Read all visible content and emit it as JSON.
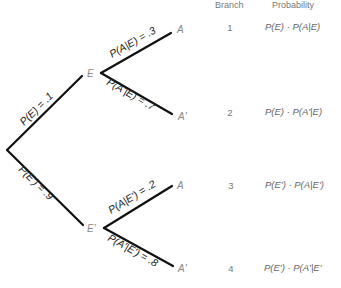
{
  "header": {
    "branch": "Branch",
    "probability": "Probability"
  },
  "nodes": {
    "E": "E",
    "E_prime": "E'",
    "A1": "A",
    "A1_prime": "A'",
    "A2": "A",
    "A2_prime": "A'"
  },
  "edge_labels": {
    "root_E": "P(E) = .1",
    "root_E_prime": "P(E') = .9",
    "E_A": "P(A|E) = .3",
    "E_A_prime": "P(A'|E) = .7",
    "Ep_A": "P(A|E') = .2",
    "Ep_A_prime": "P(A'|E') = .8"
  },
  "rows": [
    {
      "branch": "1",
      "probability": "P(E) · P(A|E)"
    },
    {
      "branch": "2",
      "probability": "P(E) · P(A'|E)"
    },
    {
      "branch": "3",
      "probability": "P(E') · P(A|E')"
    },
    {
      "branch": "4",
      "probability": "P(E') · P(A'|E'"
    }
  ]
}
